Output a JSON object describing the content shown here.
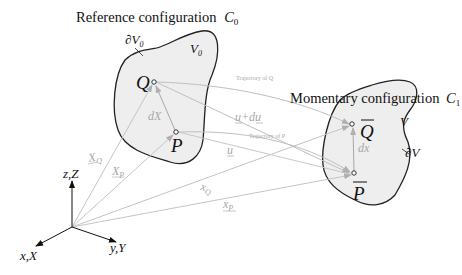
{
  "diagram": {
    "reference": {
      "title": "Reference configuration",
      "symbol": "C",
      "subscript": "0",
      "volume_label": "V",
      "volume_sub": "0",
      "boundary_label": "∂V",
      "boundary_sub": "0",
      "point_q": "Q",
      "point_p": "P",
      "element_label": "dX"
    },
    "momentary": {
      "title": "Momentary configuration",
      "symbol": "C",
      "subscript": "1",
      "volume_label": "V",
      "boundary_label": "∂V",
      "point_q": "Q",
      "point_p": "P",
      "element_label": "dx"
    },
    "trajectories": {
      "q": "Trajectory of Q",
      "p": "Trajectory of P"
    },
    "displacements": {
      "u_plus_du": "u+du",
      "u": "u"
    },
    "position_vectors": {
      "X_Q": "X",
      "X_Q_sub": "Q",
      "X_P": "X",
      "X_P_sub": "P",
      "x_Q": "x",
      "x_Q_sub": "Q",
      "x_P": "x",
      "x_P_sub": "P"
    },
    "axes": {
      "z": "z,Z",
      "x": "x,X",
      "y": "y,Y"
    },
    "colors": {
      "outline": "#222222",
      "fill": "#eeeeee",
      "vector": "#b4b4b4",
      "label_gray": "#a8a8a8",
      "axis": "#111111"
    }
  }
}
